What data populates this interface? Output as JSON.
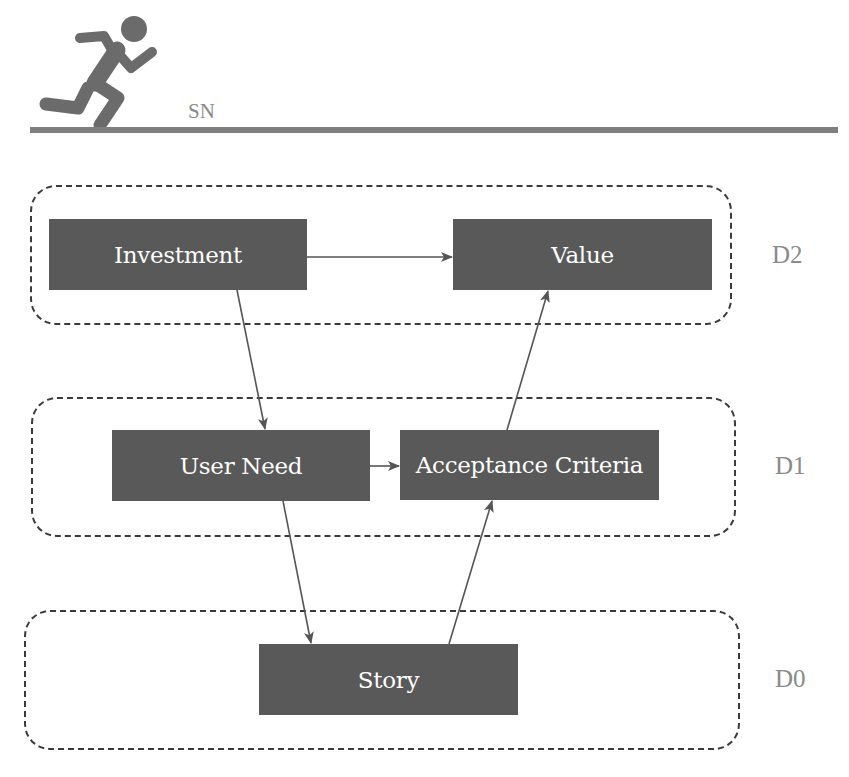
{
  "header": {
    "icon": "runner-icon",
    "label": "SN"
  },
  "groups": [
    {
      "id": "D2",
      "level_label": "D2"
    },
    {
      "id": "D1",
      "level_label": "D1"
    },
    {
      "id": "D0",
      "level_label": "D0"
    }
  ],
  "nodes": {
    "investment": "Investment",
    "value": "Value",
    "user_need": "User Need",
    "acceptance_criteria": "Acceptance Criteria",
    "story": "Story"
  },
  "edges": [
    {
      "from": "Investment",
      "to": "Value"
    },
    {
      "from": "Investment",
      "to": "User Need"
    },
    {
      "from": "User Need",
      "to": "Acceptance Criteria"
    },
    {
      "from": "User Need",
      "to": "Story"
    },
    {
      "from": "Story",
      "to": "Acceptance Criteria"
    },
    {
      "from": "Acceptance Criteria",
      "to": "Value"
    }
  ],
  "colors": {
    "node_fill": "#595959",
    "node_text": "#ffffff",
    "label_gray": "#8a8a8a",
    "arrow": "#555555",
    "dash": "#3a3a3a"
  }
}
